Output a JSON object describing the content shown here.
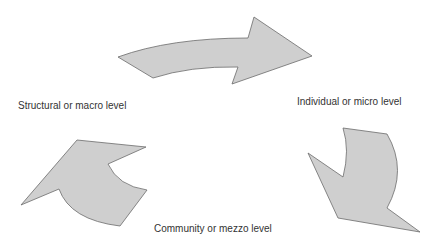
{
  "diagram": {
    "type": "cycle",
    "colors": {
      "arrow_fill": "#cfcfcf",
      "arrow_stroke": "#6b6b6b",
      "text": "#333333",
      "background": "#ffffff"
    },
    "nodes": [
      {
        "id": "structural",
        "label": "Structural or macro level"
      },
      {
        "id": "individual",
        "label": "Individual or micro level"
      },
      {
        "id": "community",
        "label": "Community or mezzo level"
      }
    ],
    "edges": [
      {
        "from": "structural",
        "to": "individual",
        "shape": "curved-arrow"
      },
      {
        "from": "individual",
        "to": "community",
        "shape": "curved-arrow"
      },
      {
        "from": "community",
        "to": "structural",
        "shape": "curved-arrow"
      }
    ]
  }
}
